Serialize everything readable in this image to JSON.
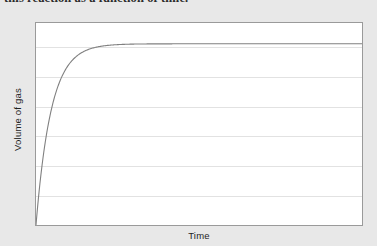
{
  "caption": {
    "text": "this reaction as a function of time."
  },
  "figure": {
    "xlabel": "Time",
    "ylabel": "Volume of gas",
    "colors": {
      "page_background": "#e8e8e8",
      "plot_background": "#ffffff",
      "plot_border": "#9a9a9a",
      "gridline": "#e2e2e2",
      "curve": "#808080",
      "text": "#1f1f1f"
    }
  },
  "chart_data": {
    "type": "line",
    "title": "",
    "xlabel": "Time",
    "ylabel": "Volume of gas",
    "xlim": [
      0,
      100
    ],
    "ylim": [
      0,
      100
    ],
    "grid": true,
    "grid_orientation": "horizontal",
    "gridline_count": 6,
    "gridline_y_values": [
      88,
      73,
      58,
      44,
      29,
      15
    ],
    "legend": null,
    "x_tick_labels": [],
    "y_tick_labels": [],
    "annotations": [],
    "series": [
      {
        "name": "Volume of gas",
        "description": "Exponential approach to a plateau: V = Vmax * (1 - exp(-k*t))",
        "color": "#808080",
        "plateau_value": 73,
        "x": [
          0,
          1,
          2,
          3,
          4,
          5,
          6,
          7,
          8,
          9,
          10,
          12,
          14,
          16,
          18,
          20,
          25,
          30,
          35,
          40,
          50,
          60,
          70,
          80,
          90,
          100
        ],
        "values": [
          0,
          17.4,
          31.4,
          42.7,
          51.8,
          59.1,
          65.0,
          69.8,
          73.6,
          76.7,
          79.2,
          82.9,
          85.3,
          86.8,
          87.8,
          88.5,
          89.3,
          89.6,
          89.7,
          89.7,
          89.7,
          89.7,
          89.7,
          89.7,
          89.7,
          89.7
        ]
      }
    ]
  }
}
